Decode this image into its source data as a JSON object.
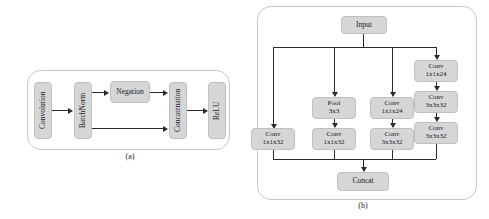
{
  "figure": {
    "panel_a": {
      "caption": "(a)",
      "nodes": [
        {
          "id": "convolution",
          "label": "Convolution",
          "orientation": "vertical"
        },
        {
          "id": "batchnorm",
          "label": "BatchNorm",
          "orientation": "vertical"
        },
        {
          "id": "negation",
          "label": "Negation",
          "orientation": "horizontal"
        },
        {
          "id": "concatenation",
          "label": "Concatenation",
          "orientation": "vertical"
        },
        {
          "id": "relu",
          "label": "ReLU",
          "orientation": "vertical"
        }
      ],
      "edges": [
        {
          "from": "convolution",
          "to": "batchnorm"
        },
        {
          "from": "batchnorm",
          "to": "negation"
        },
        {
          "from": "batchnorm",
          "to": "concatenation"
        },
        {
          "from": "negation",
          "to": "concatenation"
        },
        {
          "from": "concatenation",
          "to": "relu"
        }
      ]
    },
    "panel_b": {
      "caption": "(b)",
      "nodes": [
        {
          "id": "input",
          "label": "Input",
          "line1": "Input",
          "line2": ""
        },
        {
          "id": "pool-3x3",
          "label": "Pool 3x3",
          "line1": "Pool",
          "line2": "3x3"
        },
        {
          "id": "conv-mid-24",
          "label": "Conv 1x1x24",
          "line1": "Conv",
          "line2": "1x1x24"
        },
        {
          "id": "conv-r1-24",
          "label": "Conv 1x1x24",
          "line1": "Conv",
          "line2": "1x1x24"
        },
        {
          "id": "conv-r2-32",
          "label": "Conv 3x3x32",
          "line1": "Conv",
          "line2": "3x3x32"
        },
        {
          "id": "conv-r3-32",
          "label": "Conv 3x3x32",
          "line1": "Conv",
          "line2": "3x3x32"
        },
        {
          "id": "conv-b1-32",
          "label": "Conv 1x1x32",
          "line1": "Conv",
          "line2": "1x1x32"
        },
        {
          "id": "conv-b2-32",
          "label": "Conv 1x1x32",
          "line1": "Conv",
          "line2": "1x1x32"
        },
        {
          "id": "conv-b3-32",
          "label": "Conv 3x3x32",
          "line1": "Conv",
          "line2": "3x3x32"
        },
        {
          "id": "concat",
          "label": "Concat",
          "line1": "Concat",
          "line2": ""
        }
      ],
      "branches": [
        {
          "name": "branch-1",
          "path": [
            "Input",
            "Conv 1x1x32",
            "Concat"
          ]
        },
        {
          "name": "branch-2",
          "path": [
            "Input",
            "Pool 3x3",
            "Conv 1x1x32",
            "Concat"
          ]
        },
        {
          "name": "branch-3",
          "path": [
            "Input",
            "Conv 1x1x24",
            "Conv 3x3x32",
            "Concat"
          ]
        },
        {
          "name": "branch-4",
          "path": [
            "Input",
            "Conv 1x1x24",
            "Conv 3x3x32",
            "Conv 3x3x32",
            "Concat"
          ]
        }
      ]
    }
  },
  "colors": {
    "node_fill": "#d6d6d6",
    "node_border": "#c0c0c0",
    "container_border": "#c8c8c8",
    "connector": "#2b2b2b",
    "text": "#1a1a2e",
    "background": "#ffffff"
  }
}
